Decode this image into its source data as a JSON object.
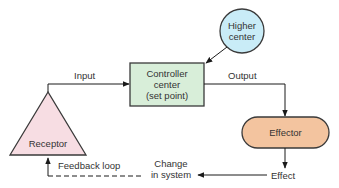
{
  "diagram": {
    "nodes": {
      "higher_center": {
        "line1": "Higher",
        "line2": "center",
        "fill": "#c9ecf7"
      },
      "controller": {
        "line1": "Controller",
        "line2": "center",
        "line3": "(set point)",
        "fill": "#d8eed9"
      },
      "effector": {
        "label": "Effector",
        "fill": "#f3c49f"
      },
      "receptor": {
        "label": "Receptor",
        "fill": "#f7dde3"
      }
    },
    "edges": {
      "input": "Input",
      "output": "Output",
      "effect": "Effect",
      "change_line1": "Change",
      "change_line2": "in system",
      "feedback": "Feedback loop"
    },
    "colors": {
      "stroke": "#3a3a3a",
      "text": "#333333"
    }
  }
}
